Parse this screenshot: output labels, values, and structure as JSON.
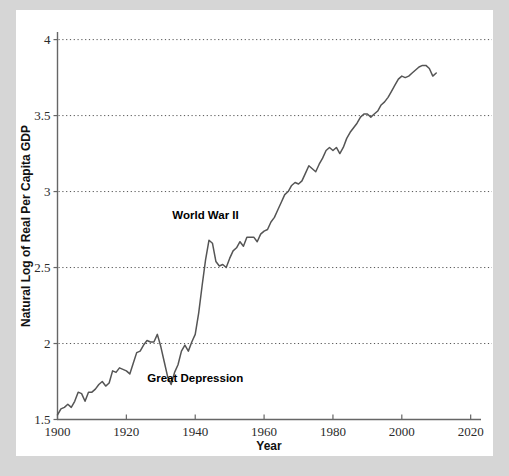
{
  "figure": {
    "background_color": "#d6d6d6",
    "card_color": "#ffffff",
    "line_color": "#555555",
    "axis_color": "#666666",
    "grid_color": "#555555"
  },
  "chart_data": {
    "type": "line",
    "title": "",
    "xlabel": "Year",
    "ylabel": "Natural Log of Real Per Capita GDP",
    "xlim": [
      1900,
      2023
    ],
    "ylim": [
      1.5,
      4.05
    ],
    "xticks": [
      1900,
      1920,
      1940,
      1960,
      1980,
      2000,
      2020
    ],
    "xtick_labels": [
      "1900",
      "1920",
      "1940",
      "1960",
      "1980",
      "2000",
      "2020"
    ],
    "yticks": [
      1.5,
      2,
      2.5,
      3,
      3.5,
      4
    ],
    "ytick_labels": [
      "1.5",
      "2",
      "2.5",
      "3",
      "3.5",
      "4"
    ],
    "grid": "horizontal-dotted",
    "grid_values": [
      2,
      2.5,
      3,
      3.5,
      4
    ],
    "legend": "none",
    "annotations": [
      {
        "text": "World War II",
        "x": 1943,
        "y": 2.82
      },
      {
        "text": "Great Depression",
        "x": 1940,
        "y": 1.745
      }
    ],
    "series": [
      {
        "name": "Natural Log of Real Per Capita GDP",
        "x": [
          1900,
          1901,
          1902,
          1903,
          1904,
          1905,
          1906,
          1907,
          1908,
          1909,
          1910,
          1911,
          1912,
          1913,
          1914,
          1915,
          1916,
          1917,
          1918,
          1919,
          1920,
          1921,
          1922,
          1923,
          1924,
          1925,
          1926,
          1927,
          1928,
          1929,
          1930,
          1931,
          1932,
          1933,
          1934,
          1935,
          1936,
          1937,
          1938,
          1939,
          1940,
          1941,
          1942,
          1943,
          1944,
          1945,
          1946,
          1947,
          1948,
          1949,
          1950,
          1951,
          1952,
          1953,
          1954,
          1955,
          1956,
          1957,
          1958,
          1959,
          1960,
          1961,
          1962,
          1963,
          1964,
          1965,
          1966,
          1967,
          1968,
          1969,
          1970,
          1971,
          1972,
          1973,
          1974,
          1975,
          1976,
          1977,
          1978,
          1979,
          1980,
          1981,
          1982,
          1983,
          1984,
          1985,
          1986,
          1987,
          1988,
          1989,
          1990,
          1991,
          1992,
          1993,
          1994,
          1995,
          1996,
          1997,
          1998,
          1999,
          2000,
          2001,
          2002,
          2003,
          2004,
          2005,
          2006,
          2007,
          2008,
          2009,
          2010
        ],
        "y": [
          1.53,
          1.57,
          1.58,
          1.6,
          1.58,
          1.62,
          1.68,
          1.67,
          1.62,
          1.68,
          1.68,
          1.7,
          1.73,
          1.75,
          1.72,
          1.74,
          1.82,
          1.81,
          1.84,
          1.83,
          1.82,
          1.8,
          1.87,
          1.94,
          1.95,
          1.99,
          2.02,
          2.01,
          2.01,
          2.06,
          1.98,
          1.88,
          1.78,
          1.73,
          1.81,
          1.86,
          1.95,
          1.99,
          1.95,
          2.01,
          2.06,
          2.2,
          2.38,
          2.55,
          2.68,
          2.66,
          2.54,
          2.51,
          2.52,
          2.5,
          2.56,
          2.61,
          2.63,
          2.67,
          2.64,
          2.7,
          2.7,
          2.7,
          2.67,
          2.72,
          2.74,
          2.75,
          2.8,
          2.83,
          2.88,
          2.93,
          2.98,
          3.0,
          3.04,
          3.06,
          3.05,
          3.07,
          3.12,
          3.17,
          3.15,
          3.13,
          3.18,
          3.22,
          3.27,
          3.29,
          3.27,
          3.29,
          3.25,
          3.29,
          3.35,
          3.39,
          3.42,
          3.45,
          3.49,
          3.51,
          3.51,
          3.49,
          3.51,
          3.53,
          3.57,
          3.59,
          3.62,
          3.66,
          3.7,
          3.74,
          3.76,
          3.75,
          3.76,
          3.78,
          3.8,
          3.82,
          3.83,
          3.83,
          3.81,
          3.76,
          3.78
        ]
      }
    ]
  }
}
